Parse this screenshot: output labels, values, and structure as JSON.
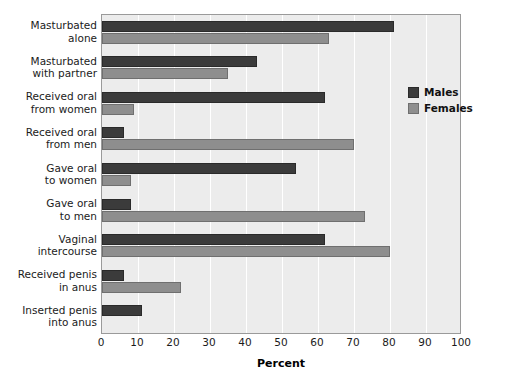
{
  "chart_data": {
    "type": "bar",
    "orientation": "horizontal",
    "title": "",
    "xlabel": "Percent",
    "ylabel": "",
    "xlim": [
      0,
      100
    ],
    "xticks": [
      0,
      10,
      20,
      30,
      40,
      50,
      60,
      70,
      80,
      90,
      100
    ],
    "grid": true,
    "legend_position": "right-upper",
    "categories": [
      "Masturbated\nalone",
      "Masturbated\nwith partner",
      "Received oral\nfrom women",
      "Received oral\nfrom men",
      "Gave oral\nto women",
      "Gave oral\nto men",
      "Vaginal\nintercourse",
      "Received penis\nin anus",
      "Inserted penis\ninto anus"
    ],
    "series": [
      {
        "name": "Males",
        "color": "#3b3b3b",
        "values": [
          81,
          43,
          62,
          6,
          54,
          8,
          62,
          6,
          11
        ]
      },
      {
        "name": "Females",
        "color": "#8e8e8e",
        "values": [
          63,
          35,
          9,
          70,
          8,
          73,
          80,
          22,
          0
        ]
      }
    ]
  },
  "legend": {
    "items": [
      {
        "label": "Males"
      },
      {
        "label": "Females"
      }
    ]
  },
  "axis": {
    "x_title": "Percent"
  }
}
